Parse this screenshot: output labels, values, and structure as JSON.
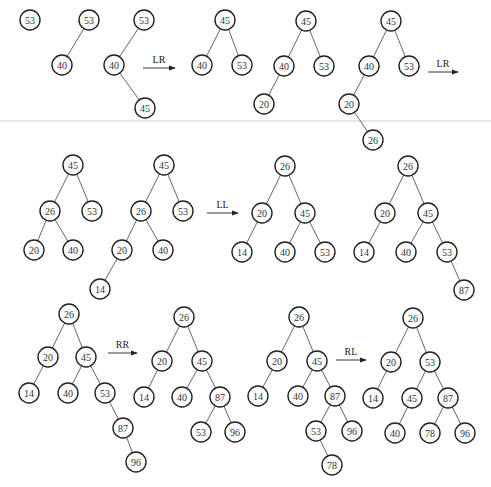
{
  "colors": {
    "stroke": "#222222",
    "edge": "#555555",
    "text": "#333333",
    "background": "#ffffff"
  },
  "node_radius": 10,
  "trees": [
    {
      "id": "t1",
      "nodes": [
        {
          "v": "53",
          "x": 30,
          "y": 20
        }
      ],
      "edges": []
    },
    {
      "id": "t2",
      "nodes": [
        {
          "v": "53",
          "x": 89,
          "y": 20
        },
        {
          "v": "40",
          "x": 62,
          "y": 65
        }
      ],
      "edges": [
        [
          0,
          1
        ]
      ]
    },
    {
      "id": "t3",
      "nodes": [
        {
          "v": "53",
          "x": 144,
          "y": 20
        },
        {
          "v": "40",
          "x": 114,
          "y": 65
        },
        {
          "v": "45",
          "x": 145,
          "y": 108
        }
      ],
      "edges": [
        [
          0,
          1
        ],
        [
          1,
          2
        ]
      ]
    },
    {
      "id": "t4",
      "nodes": [
        {
          "v": "45",
          "x": 225,
          "y": 20
        },
        {
          "v": "40",
          "x": 202,
          "y": 65
        },
        {
          "v": "53",
          "x": 242,
          "y": 65
        }
      ],
      "edges": [
        [
          0,
          1
        ],
        [
          0,
          2
        ]
      ]
    },
    {
      "id": "t5",
      "nodes": [
        {
          "v": "45",
          "x": 306,
          "y": 21
        },
        {
          "v": "40",
          "x": 284,
          "y": 66
        },
        {
          "v": "53",
          "x": 324,
          "y": 66
        },
        {
          "v": "20",
          "x": 264,
          "y": 104
        }
      ],
      "edges": [
        [
          0,
          1
        ],
        [
          0,
          2
        ],
        [
          1,
          3
        ]
      ]
    },
    {
      "id": "t6",
      "nodes": [
        {
          "v": "45",
          "x": 391,
          "y": 21
        },
        {
          "v": "40",
          "x": 369,
          "y": 66
        },
        {
          "v": "53",
          "x": 409,
          "y": 66
        },
        {
          "v": "20",
          "x": 349,
          "y": 104
        },
        {
          "v": "26",
          "x": 373,
          "y": 140
        }
      ],
      "edges": [
        [
          0,
          1
        ],
        [
          0,
          2
        ],
        [
          1,
          3
        ],
        [
          3,
          4
        ]
      ]
    },
    {
      "id": "t7",
      "nodes": [
        {
          "v": "45",
          "x": 73,
          "y": 165
        },
        {
          "v": "26",
          "x": 50,
          "y": 211
        },
        {
          "v": "53",
          "x": 92,
          "y": 211
        },
        {
          "v": "20",
          "x": 34,
          "y": 250
        },
        {
          "v": "40",
          "x": 73,
          "y": 250
        }
      ],
      "edges": [
        [
          0,
          1
        ],
        [
          0,
          2
        ],
        [
          1,
          3
        ],
        [
          1,
          4
        ]
      ]
    },
    {
      "id": "t8",
      "nodes": [
        {
          "v": "45",
          "x": 164,
          "y": 165
        },
        {
          "v": "26",
          "x": 141,
          "y": 211
        },
        {
          "v": "53",
          "x": 183,
          "y": 211
        },
        {
          "v": "20",
          "x": 122,
          "y": 250
        },
        {
          "v": "40",
          "x": 163,
          "y": 250
        },
        {
          "v": "14",
          "x": 100,
          "y": 289
        }
      ],
      "edges": [
        [
          0,
          1
        ],
        [
          0,
          2
        ],
        [
          1,
          3
        ],
        [
          1,
          4
        ],
        [
          3,
          5
        ]
      ]
    },
    {
      "id": "t9",
      "nodes": [
        {
          "v": "26",
          "x": 285,
          "y": 166
        },
        {
          "v": "20",
          "x": 262,
          "y": 213
        },
        {
          "v": "45",
          "x": 305,
          "y": 213
        },
        {
          "v": "14",
          "x": 242,
          "y": 252
        },
        {
          "v": "40",
          "x": 285,
          "y": 252
        },
        {
          "v": "53",
          "x": 325,
          "y": 252
        }
      ],
      "edges": [
        [
          0,
          1
        ],
        [
          0,
          2
        ],
        [
          1,
          3
        ],
        [
          2,
          4
        ],
        [
          2,
          5
        ]
      ]
    },
    {
      "id": "t10",
      "nodes": [
        {
          "v": "26",
          "x": 408,
          "y": 166
        },
        {
          "v": "20",
          "x": 385,
          "y": 213
        },
        {
          "v": "45",
          "x": 428,
          "y": 213
        },
        {
          "v": "14",
          "x": 364,
          "y": 252
        },
        {
          "v": "40",
          "x": 406,
          "y": 252
        },
        {
          "v": "53",
          "x": 447,
          "y": 252
        },
        {
          "v": "87",
          "x": 464,
          "y": 290
        }
      ],
      "edges": [
        [
          0,
          1
        ],
        [
          0,
          2
        ],
        [
          1,
          3
        ],
        [
          2,
          4
        ],
        [
          2,
          5
        ],
        [
          5,
          6
        ]
      ]
    },
    {
      "id": "t11",
      "nodes": [
        {
          "v": "26",
          "x": 69,
          "y": 314
        },
        {
          "v": "20",
          "x": 48,
          "y": 357
        },
        {
          "v": "45",
          "x": 86,
          "y": 357
        },
        {
          "v": "14",
          "x": 29,
          "y": 393
        },
        {
          "v": "40",
          "x": 68,
          "y": 393
        },
        {
          "v": "53",
          "x": 105,
          "y": 393
        },
        {
          "v": "87",
          "x": 123,
          "y": 428
        },
        {
          "v": "96",
          "x": 136,
          "y": 462
        }
      ],
      "edges": [
        [
          0,
          1
        ],
        [
          0,
          2
        ],
        [
          1,
          3
        ],
        [
          2,
          4
        ],
        [
          2,
          5
        ],
        [
          5,
          6
        ],
        [
          6,
          7
        ]
      ]
    },
    {
      "id": "t12",
      "nodes": [
        {
          "v": "26",
          "x": 184,
          "y": 317
        },
        {
          "v": "20",
          "x": 162,
          "y": 361
        },
        {
          "v": "45",
          "x": 202,
          "y": 361
        },
        {
          "v": "14",
          "x": 144,
          "y": 397
        },
        {
          "v": "40",
          "x": 182,
          "y": 397
        },
        {
          "v": "87",
          "x": 220,
          "y": 397
        },
        {
          "v": "53",
          "x": 201,
          "y": 432
        },
        {
          "v": "96",
          "x": 235,
          "y": 432
        }
      ],
      "edges": [
        [
          0,
          1
        ],
        [
          0,
          2
        ],
        [
          1,
          3
        ],
        [
          2,
          4
        ],
        [
          2,
          5
        ],
        [
          5,
          6
        ],
        [
          5,
          7
        ]
      ]
    },
    {
      "id": "t13",
      "nodes": [
        {
          "v": "26",
          "x": 299,
          "y": 317
        },
        {
          "v": "20",
          "x": 277,
          "y": 361
        },
        {
          "v": "45",
          "x": 317,
          "y": 361
        },
        {
          "v": "14",
          "x": 258,
          "y": 396
        },
        {
          "v": "40",
          "x": 298,
          "y": 396
        },
        {
          "v": "87",
          "x": 335,
          "y": 396
        },
        {
          "v": "53",
          "x": 316,
          "y": 431
        },
        {
          "v": "96",
          "x": 352,
          "y": 431
        },
        {
          "v": "78",
          "x": 332,
          "y": 465
        }
      ],
      "edges": [
        [
          0,
          1
        ],
        [
          0,
          2
        ],
        [
          1,
          3
        ],
        [
          2,
          4
        ],
        [
          2,
          5
        ],
        [
          5,
          6
        ],
        [
          5,
          7
        ],
        [
          6,
          8
        ]
      ]
    },
    {
      "id": "t14",
      "nodes": [
        {
          "v": "26",
          "x": 413,
          "y": 318
        },
        {
          "v": "20",
          "x": 391,
          "y": 362
        },
        {
          "v": "53",
          "x": 430,
          "y": 362
        },
        {
          "v": "14",
          "x": 373,
          "y": 398
        },
        {
          "v": "45",
          "x": 412,
          "y": 398
        },
        {
          "v": "87",
          "x": 448,
          "y": 398
        },
        {
          "v": "40",
          "x": 395,
          "y": 433
        },
        {
          "v": "78",
          "x": 430,
          "y": 433
        },
        {
          "v": "96",
          "x": 465,
          "y": 433
        }
      ],
      "edges": [
        [
          0,
          1
        ],
        [
          0,
          2
        ],
        [
          1,
          3
        ],
        [
          2,
          4
        ],
        [
          2,
          5
        ],
        [
          4,
          6
        ],
        [
          5,
          7
        ],
        [
          5,
          8
        ]
      ]
    }
  ],
  "arrows": [
    {
      "label": "LR",
      "x1": 143,
      "x2": 175,
      "y": 68
    },
    {
      "label": "LR",
      "x1": 428,
      "x2": 458,
      "y": 72
    },
    {
      "label": "LL",
      "x1": 207,
      "x2": 238,
      "y": 213
    },
    {
      "label": "RR",
      "x1": 108,
      "x2": 137,
      "y": 353
    },
    {
      "label": "RL",
      "x1": 336,
      "x2": 366,
      "y": 360
    }
  ]
}
